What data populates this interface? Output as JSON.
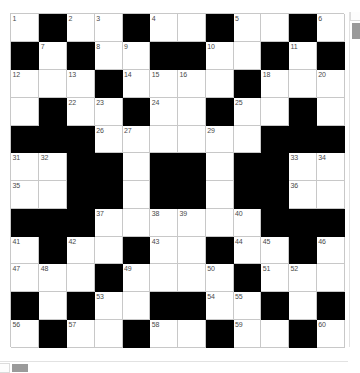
{
  "puzzle": {
    "title": "Crossword Grid",
    "rows": 12,
    "columns": 12,
    "colors": {
      "block": "#000000",
      "cell": "#ffffff",
      "gridline": "#c8c8c8",
      "number_text": "#4a4a4a",
      "page_background": "#ffffff",
      "scrollbar_thumb": "#9a9a9a"
    },
    "grid": [
      [
        {
          "block": false,
          "number": "1"
        },
        {
          "block": true,
          "number": ""
        },
        {
          "block": false,
          "number": "2"
        },
        {
          "block": false,
          "number": "3"
        },
        {
          "block": true,
          "number": ""
        },
        {
          "block": false,
          "number": "4"
        },
        {
          "block": false,
          "number": ""
        },
        {
          "block": true,
          "number": ""
        },
        {
          "block": false,
          "number": "5"
        },
        {
          "block": false,
          "number": ""
        },
        {
          "block": true,
          "number": ""
        },
        {
          "block": false,
          "number": "6"
        }
      ],
      [
        {
          "block": true,
          "number": ""
        },
        {
          "block": false,
          "number": "7"
        },
        {
          "block": true,
          "number": ""
        },
        {
          "block": false,
          "number": "8"
        },
        {
          "block": false,
          "number": "9"
        },
        {
          "block": true,
          "number": ""
        },
        {
          "block": true,
          "number": ""
        },
        {
          "block": false,
          "number": "10"
        },
        {
          "block": false,
          "number": ""
        },
        {
          "block": true,
          "number": ""
        },
        {
          "block": false,
          "number": "11"
        },
        {
          "block": true,
          "number": ""
        }
      ],
      [
        {
          "block": false,
          "number": "12"
        },
        {
          "block": false,
          "number": ""
        },
        {
          "block": false,
          "number": "13"
        },
        {
          "block": true,
          "number": ""
        },
        {
          "block": false,
          "number": "14"
        },
        {
          "block": false,
          "number": "15"
        },
        {
          "block": false,
          "number": "16"
        },
        {
          "block": false,
          "number": ""
        },
        {
          "block": true,
          "number": ""
        },
        {
          "block": false,
          "number": "18"
        },
        {
          "block": false,
          "number": ""
        },
        {
          "block": false,
          "number": "20"
        }
      ],
      [
        {
          "block": false,
          "number": ""
        },
        {
          "block": true,
          "number": ""
        },
        {
          "block": false,
          "number": "22"
        },
        {
          "block": false,
          "number": "23"
        },
        {
          "block": true,
          "number": ""
        },
        {
          "block": false,
          "number": "24"
        },
        {
          "block": false,
          "number": ""
        },
        {
          "block": true,
          "number": ""
        },
        {
          "block": false,
          "number": "25"
        },
        {
          "block": false,
          "number": ""
        },
        {
          "block": true,
          "number": ""
        },
        {
          "block": false,
          "number": ""
        }
      ],
      [
        {
          "block": true,
          "number": ""
        },
        {
          "block": true,
          "number": ""
        },
        {
          "block": true,
          "number": ""
        },
        {
          "block": false,
          "number": "26"
        },
        {
          "block": false,
          "number": "27"
        },
        {
          "block": false,
          "number": ""
        },
        {
          "block": false,
          "number": ""
        },
        {
          "block": false,
          "number": "29"
        },
        {
          "block": false,
          "number": ""
        },
        {
          "block": true,
          "number": ""
        },
        {
          "block": true,
          "number": ""
        },
        {
          "block": true,
          "number": ""
        }
      ],
      [
        {
          "block": false,
          "number": "31"
        },
        {
          "block": false,
          "number": "32"
        },
        {
          "block": true,
          "number": ""
        },
        {
          "block": true,
          "number": ""
        },
        {
          "block": false,
          "number": ""
        },
        {
          "block": true,
          "number": ""
        },
        {
          "block": true,
          "number": ""
        },
        {
          "block": false,
          "number": ""
        },
        {
          "block": true,
          "number": ""
        },
        {
          "block": true,
          "number": ""
        },
        {
          "block": false,
          "number": "33"
        },
        {
          "block": false,
          "number": "34"
        }
      ],
      [
        {
          "block": false,
          "number": "35"
        },
        {
          "block": false,
          "number": ""
        },
        {
          "block": true,
          "number": ""
        },
        {
          "block": true,
          "number": ""
        },
        {
          "block": false,
          "number": ""
        },
        {
          "block": true,
          "number": ""
        },
        {
          "block": true,
          "number": ""
        },
        {
          "block": false,
          "number": ""
        },
        {
          "block": true,
          "number": ""
        },
        {
          "block": true,
          "number": ""
        },
        {
          "block": false,
          "number": "36"
        },
        {
          "block": false,
          "number": ""
        }
      ],
      [
        {
          "block": true,
          "number": ""
        },
        {
          "block": true,
          "number": ""
        },
        {
          "block": true,
          "number": ""
        },
        {
          "block": false,
          "number": "37"
        },
        {
          "block": false,
          "number": ""
        },
        {
          "block": false,
          "number": "38"
        },
        {
          "block": false,
          "number": "39"
        },
        {
          "block": false,
          "number": ""
        },
        {
          "block": false,
          "number": "40"
        },
        {
          "block": true,
          "number": ""
        },
        {
          "block": true,
          "number": ""
        },
        {
          "block": true,
          "number": ""
        }
      ],
      [
        {
          "block": false,
          "number": "41"
        },
        {
          "block": true,
          "number": ""
        },
        {
          "block": false,
          "number": "42"
        },
        {
          "block": false,
          "number": ""
        },
        {
          "block": true,
          "number": ""
        },
        {
          "block": false,
          "number": "43"
        },
        {
          "block": false,
          "number": ""
        },
        {
          "block": true,
          "number": ""
        },
        {
          "block": false,
          "number": "44"
        },
        {
          "block": false,
          "number": "45"
        },
        {
          "block": true,
          "number": ""
        },
        {
          "block": false,
          "number": "46"
        }
      ],
      [
        {
          "block": false,
          "number": "47"
        },
        {
          "block": false,
          "number": "48"
        },
        {
          "block": false,
          "number": ""
        },
        {
          "block": true,
          "number": ""
        },
        {
          "block": false,
          "number": "49"
        },
        {
          "block": false,
          "number": ""
        },
        {
          "block": false,
          "number": ""
        },
        {
          "block": false,
          "number": "50"
        },
        {
          "block": true,
          "number": ""
        },
        {
          "block": false,
          "number": "51"
        },
        {
          "block": false,
          "number": "52"
        },
        {
          "block": false,
          "number": ""
        }
      ],
      [
        {
          "block": true,
          "number": ""
        },
        {
          "block": false,
          "number": ""
        },
        {
          "block": true,
          "number": ""
        },
        {
          "block": false,
          "number": "53"
        },
        {
          "block": false,
          "number": ""
        },
        {
          "block": true,
          "number": ""
        },
        {
          "block": true,
          "number": ""
        },
        {
          "block": false,
          "number": "54"
        },
        {
          "block": false,
          "number": "55"
        },
        {
          "block": true,
          "number": ""
        },
        {
          "block": false,
          "number": ""
        },
        {
          "block": true,
          "number": ""
        }
      ],
      [
        {
          "block": false,
          "number": "56"
        },
        {
          "block": true,
          "number": ""
        },
        {
          "block": false,
          "number": "57"
        },
        {
          "block": false,
          "number": ""
        },
        {
          "block": true,
          "number": ""
        },
        {
          "block": false,
          "number": "58"
        },
        {
          "block": false,
          "number": ""
        },
        {
          "block": true,
          "number": ""
        },
        {
          "block": false,
          "number": "59"
        },
        {
          "block": false,
          "number": ""
        },
        {
          "block": true,
          "number": ""
        },
        {
          "block": false,
          "number": "60"
        }
      ]
    ]
  },
  "scrollbars": {
    "vertical_label": "vertical-scrollbar",
    "horizontal_label": "horizontal-scrollbar"
  }
}
